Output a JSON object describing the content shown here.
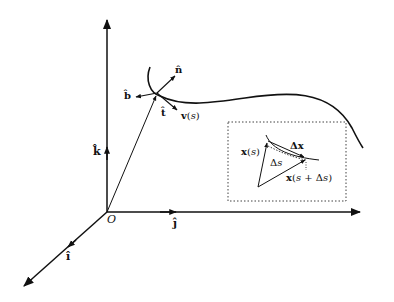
{
  "diagram": {
    "type": "Frenet frame along a space curve",
    "axes": {
      "origin_label": "O",
      "x_unit_label": "î",
      "y_unit_label": "ĵ",
      "z_unit_label": "k̂"
    },
    "frame_vectors": {
      "tangent": "t̂",
      "normal": "n̂",
      "binormal": "b̂",
      "velocity": "v(s)"
    },
    "inset": {
      "position_label": "x(s)",
      "position_next_label": "x(s + Δs)",
      "chord_label": "Δx",
      "arc_label": "Δs"
    },
    "colors": {
      "stroke": "#111111",
      "background": "#ffffff"
    }
  }
}
